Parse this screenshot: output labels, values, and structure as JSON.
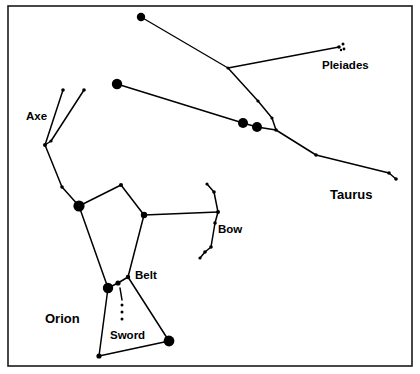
{
  "chart_data": {
    "type": "scatter",
    "title": "",
    "subtitle": "",
    "xlabel": "",
    "ylabel": "",
    "grid": false,
    "legend_position": "none",
    "xlim": [
      0,
      420
    ],
    "ylim": [
      0,
      374
    ],
    "labels": [
      {
        "id": "pleiades",
        "text": "Pleiades",
        "x": 322,
        "y": 69,
        "bold": false,
        "size": 11.5
      },
      {
        "id": "taurus",
        "text": "Taurus",
        "x": 330,
        "y": 199,
        "bold": true,
        "size": 13
      },
      {
        "id": "axe",
        "text": "Axe",
        "x": 26,
        "y": 120,
        "bold": false,
        "size": 11.5
      },
      {
        "id": "bow",
        "text": "Bow",
        "x": 218,
        "y": 233,
        "bold": false,
        "size": 11.5
      },
      {
        "id": "belt",
        "text": "Belt",
        "x": 135,
        "y": 279,
        "bold": false,
        "size": 11.5
      },
      {
        "id": "sword",
        "text": "Sword",
        "x": 110,
        "y": 339,
        "bold": false,
        "size": 11.5
      },
      {
        "id": "orion",
        "text": "Orion",
        "x": 45,
        "y": 323,
        "bold": true,
        "size": 13
      }
    ],
    "frame": {
      "x": 8,
      "y": 6,
      "width": 404,
      "height": 360
    },
    "stars": [
      {
        "name": "orion-club-top",
        "x": 141,
        "y": 17,
        "r": 4.2
      },
      {
        "name": "taurus-horn-bend",
        "x": 228,
        "y": 68,
        "r": 1.6
      },
      {
        "name": "pleiades-cluster-a",
        "x": 339,
        "y": 47,
        "r": 1.8
      },
      {
        "name": "pleiades-cluster-b",
        "x": 343,
        "y": 44,
        "r": 1.5
      },
      {
        "name": "pleiades-cluster-c",
        "x": 344,
        "y": 49,
        "r": 1.4
      },
      {
        "name": "pleiades-cluster-d",
        "x": 341,
        "y": 50,
        "r": 1.2
      },
      {
        "name": "taurus-horn-mid",
        "x": 258,
        "y": 101,
        "r": 1.6
      },
      {
        "name": "taurus-horn-low",
        "x": 272,
        "y": 118,
        "r": 1.6
      },
      {
        "name": "bellatrix-upper",
        "x": 117,
        "y": 84,
        "r": 5.2
      },
      {
        "name": "hyades-bright-a",
        "x": 243,
        "y": 123,
        "r": 5.0
      },
      {
        "name": "aldebaran",
        "x": 257,
        "y": 127,
        "r": 5.0
      },
      {
        "name": "taurus-junction",
        "x": 276,
        "y": 130,
        "r": 1.8
      },
      {
        "name": "taurus-body-mid",
        "x": 316,
        "y": 155,
        "r": 1.8
      },
      {
        "name": "taurus-body-end",
        "x": 389,
        "y": 173,
        "r": 1.8
      },
      {
        "name": "taurus-tail-tip",
        "x": 396,
        "y": 179,
        "r": 1.8
      },
      {
        "name": "axe-tip-left",
        "x": 63,
        "y": 90,
        "r": 1.8
      },
      {
        "name": "axe-tip-right",
        "x": 84,
        "y": 90,
        "r": 1.8
      },
      {
        "name": "axe-vertex",
        "x": 45,
        "y": 145,
        "r": 2.0
      },
      {
        "name": "axe-inner-joint",
        "x": 51,
        "y": 141,
        "r": 1.6
      },
      {
        "name": "orion-arm-mid",
        "x": 62,
        "y": 187,
        "r": 1.8
      },
      {
        "name": "betelgeuse",
        "x": 79,
        "y": 206,
        "r": 5.6
      },
      {
        "name": "orion-shoulder-top",
        "x": 121,
        "y": 185,
        "r": 2.0
      },
      {
        "name": "bellatrix-shoulder",
        "x": 144,
        "y": 215,
        "r": 3.2
      },
      {
        "name": "bow-top-tip",
        "x": 207,
        "y": 184,
        "r": 1.6
      },
      {
        "name": "bow-upper-bend",
        "x": 214,
        "y": 192,
        "r": 1.8
      },
      {
        "name": "bow-center",
        "x": 218,
        "y": 212,
        "r": 2.0
      },
      {
        "name": "bow-lower-a",
        "x": 215,
        "y": 223,
        "r": 1.8
      },
      {
        "name": "bow-lower-b",
        "x": 211,
        "y": 247,
        "r": 1.8
      },
      {
        "name": "bow-bottom-bend",
        "x": 205,
        "y": 252,
        "r": 1.8
      },
      {
        "name": "bow-bottom-tip",
        "x": 200,
        "y": 258,
        "r": 1.6
      },
      {
        "name": "alnitak",
        "x": 128,
        "y": 277,
        "r": 2.2
      },
      {
        "name": "alnilam",
        "x": 118,
        "y": 283,
        "r": 2.6
      },
      {
        "name": "saiph-belt-bright",
        "x": 108,
        "y": 288,
        "r": 5.2
      },
      {
        "name": "sword-upper",
        "x": 122,
        "y": 305,
        "r": 1.5
      },
      {
        "name": "sword-mid",
        "x": 122,
        "y": 312,
        "r": 1.5
      },
      {
        "name": "sword-lower",
        "x": 122,
        "y": 319,
        "r": 1.5
      },
      {
        "name": "orion-foot-left",
        "x": 99,
        "y": 356,
        "r": 2.6
      },
      {
        "name": "rigel",
        "x": 169,
        "y": 341,
        "r": 5.4
      }
    ],
    "lines": [
      {
        "name": "club-to-horn-vertex",
        "points": [
          [
            141,
            17
          ],
          [
            228,
            68
          ]
        ],
        "width": 1.3
      },
      {
        "name": "horn-vertex-to-pleiades",
        "points": [
          [
            228,
            68
          ],
          [
            339,
            47
          ]
        ],
        "width": 1.3
      },
      {
        "name": "horn-vertex-down-to-junction",
        "points": [
          [
            228,
            68
          ],
          [
            258,
            101
          ],
          [
            272,
            118
          ],
          [
            276,
            130
          ]
        ],
        "width": 1.5
      },
      {
        "name": "bellatrix-to-hyades",
        "points": [
          [
            117,
            84
          ],
          [
            243,
            123
          ],
          [
            257,
            127
          ],
          [
            276,
            130
          ]
        ],
        "width": 1.5
      },
      {
        "name": "junction-to-tail",
        "points": [
          [
            276,
            130
          ],
          [
            316,
            155
          ],
          [
            389,
            173
          ],
          [
            396,
            179
          ]
        ],
        "width": 1.5
      },
      {
        "name": "axe-left-arm",
        "points": [
          [
            63,
            90
          ],
          [
            45,
            145
          ]
        ],
        "width": 1.5
      },
      {
        "name": "axe-right-arm",
        "points": [
          [
            84,
            90
          ],
          [
            51,
            141
          ]
        ],
        "width": 1.5
      },
      {
        "name": "axe-inner-link",
        "points": [
          [
            45,
            145
          ],
          [
            51,
            141
          ]
        ],
        "width": 1.5
      },
      {
        "name": "axe-to-betelgeuse",
        "points": [
          [
            45,
            145
          ],
          [
            62,
            187
          ],
          [
            79,
            206
          ]
        ],
        "width": 1.5
      },
      {
        "name": "orion-shoulder-line",
        "points": [
          [
            79,
            206
          ],
          [
            121,
            185
          ],
          [
            144,
            215
          ]
        ],
        "width": 1.5
      },
      {
        "name": "shoulder-to-bow",
        "points": [
          [
            144,
            215
          ],
          [
            218,
            212
          ]
        ],
        "width": 1.5
      },
      {
        "name": "bow-arc",
        "points": [
          [
            207,
            184
          ],
          [
            214,
            192
          ],
          [
            218,
            212
          ],
          [
            215,
            223
          ],
          [
            211,
            247
          ],
          [
            205,
            252
          ],
          [
            200,
            258
          ]
        ],
        "width": 1.5
      },
      {
        "name": "betelgeuse-to-belt",
        "points": [
          [
            79,
            206
          ],
          [
            108,
            288
          ]
        ],
        "width": 1.5
      },
      {
        "name": "shoulder-to-alnitak",
        "points": [
          [
            144,
            215
          ],
          [
            128,
            277
          ]
        ],
        "width": 1.5
      },
      {
        "name": "belt-line",
        "points": [
          [
            108,
            288
          ],
          [
            118,
            283
          ],
          [
            128,
            277
          ]
        ],
        "width": 1.5
      },
      {
        "name": "belt-to-rigel",
        "points": [
          [
            128,
            277
          ],
          [
            169,
            341
          ]
        ],
        "width": 1.5
      },
      {
        "name": "belt-to-foot",
        "points": [
          [
            108,
            288
          ],
          [
            99,
            356
          ]
        ],
        "width": 1.5
      },
      {
        "name": "foot-to-rigel",
        "points": [
          [
            99,
            356
          ],
          [
            169,
            341
          ]
        ],
        "width": 1.5
      },
      {
        "name": "sword-stem",
        "points": [
          [
            120,
            288
          ],
          [
            122,
            300
          ]
        ],
        "width": 1.5
      }
    ]
  }
}
